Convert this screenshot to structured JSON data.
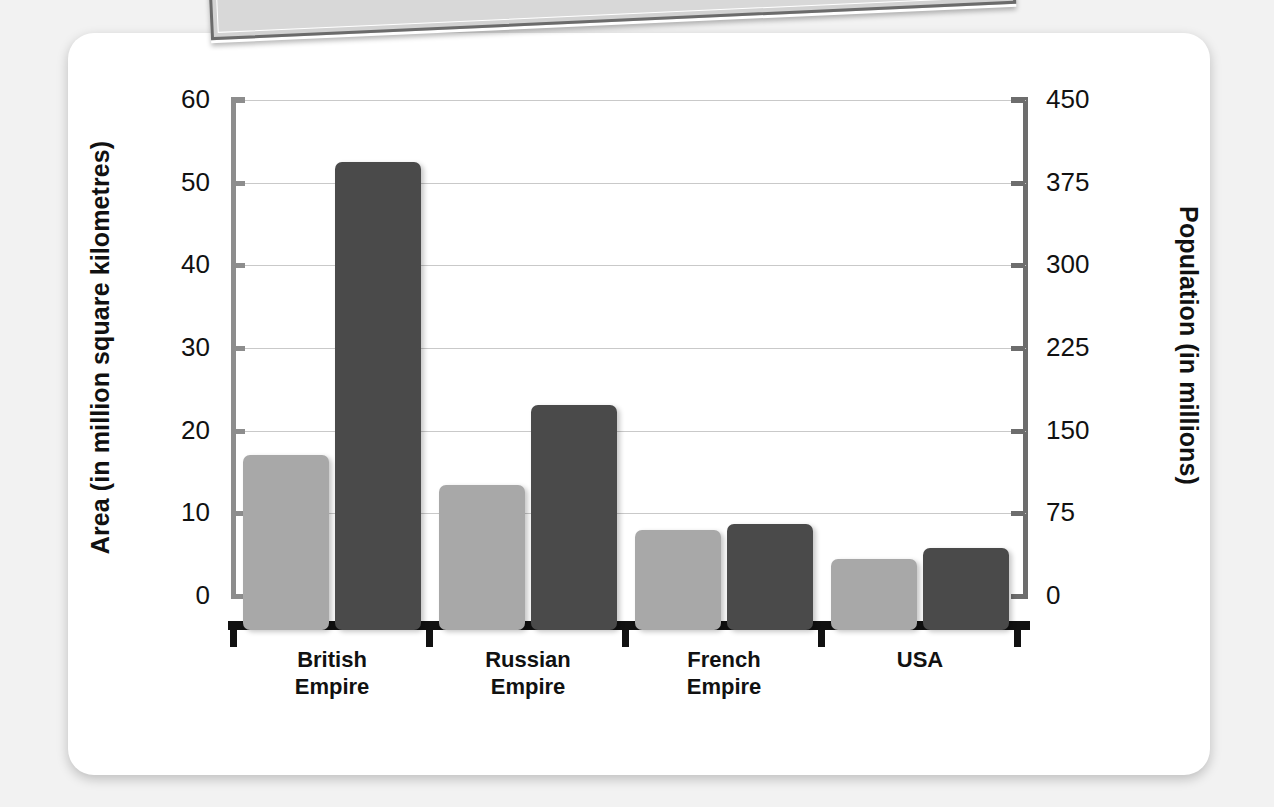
{
  "chart_data": {
    "type": "bar",
    "title": "",
    "categories": [
      "British Empire",
      "Russian Empire",
      "French Empire",
      "USA"
    ],
    "category_lines": [
      [
        "British",
        "Empire"
      ],
      [
        "Russian",
        "Empire"
      ],
      [
        "French",
        "Empire"
      ],
      [
        "USA",
        ""
      ]
    ],
    "series": [
      {
        "name": "Area",
        "axis": "left",
        "unit": "million square kilometres",
        "color": "#a8a8a8",
        "values": [
          17,
          13.4,
          8,
          4.5
        ]
      },
      {
        "name": "Population",
        "axis": "right",
        "unit": "millions",
        "color": "#4a4a4a",
        "values": [
          394,
          173,
          65,
          44
        ]
      }
    ],
    "left_axis": {
      "label": "Area (in million square kilometres)",
      "ticks": [
        0,
        10,
        20,
        30,
        40,
        50,
        60
      ],
      "tick_labels": [
        "0",
        "10",
        "20",
        "30",
        "40",
        "50",
        "60"
      ],
      "range": [
        0,
        60
      ]
    },
    "right_axis": {
      "label": "Population (in millions)",
      "ticks": [
        0,
        75,
        150,
        225,
        300,
        375,
        450
      ],
      "tick_labels": [
        "0",
        "75",
        "150",
        "225",
        "300",
        "375",
        "450"
      ],
      "range": [
        0,
        450
      ]
    },
    "xlabel": "",
    "grid": true,
    "legend": "none",
    "gridlines_at_left_values": [
      10,
      20,
      30,
      40,
      50,
      60
    ]
  },
  "decor": {
    "tilted_panel_name": "decorative-tilted-panel",
    "card_background": "#ffffff",
    "page_background": "#f2f2f2"
  }
}
